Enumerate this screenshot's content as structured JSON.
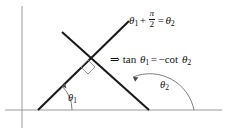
{
  "figure": {
    "background_color": "#ffffff",
    "width": 231,
    "height": 135
  },
  "axes": {
    "color": "#9a9a9a",
    "x_axis": {
      "name": "horizontal-axis",
      "x1": 5,
      "y1": 110,
      "x2": 222,
      "y2": 110
    },
    "y_axis": {
      "name": "vertical-axis",
      "x1": 22,
      "y1": 6,
      "x2": 22,
      "y2": 128
    }
  },
  "lines": {
    "color": "#1a1a1a",
    "rising": {
      "label": "line-theta1",
      "x1": 38,
      "y1": 110,
      "x2": 129,
      "y2": 21
    },
    "falling": {
      "label": "line-theta2",
      "x1": 62,
      "y1": 32,
      "x2": 149,
      "y2": 110
    }
  },
  "right_angle": {
    "label": "right-angle-marker",
    "points": "88,60 95,67 88,74 81,67"
  },
  "angles": {
    "theta1": {
      "name": "theta-1",
      "label_main": "θ",
      "label_sub": "1",
      "vertex_x": 38,
      "vertex_y": 110,
      "value_text": "θ₁"
    },
    "theta2": {
      "name": "theta-2",
      "label_main": "θ",
      "label_sub": "2",
      "vertex_x": 149,
      "vertex_y": 110,
      "value_text": "θ₂"
    }
  },
  "equations": {
    "top": {
      "name": "equation-theta-sum",
      "plain_text": "θ₁ + π/2 = θ₂",
      "theta": "θ",
      "sub1": "1",
      "plus": "+",
      "numerator": "π",
      "denominator": "2",
      "equals": "=",
      "sub2": "2"
    },
    "middle": {
      "name": "equation-tan-cot",
      "plain_text": "⇒ tan θ₁ = −cot θ₂",
      "implies": "⇒",
      "tan": "tan",
      "theta": "θ",
      "sub1": "1",
      "equals": "=",
      "minus": "−",
      "cot": "cot",
      "sub2": "2"
    }
  }
}
